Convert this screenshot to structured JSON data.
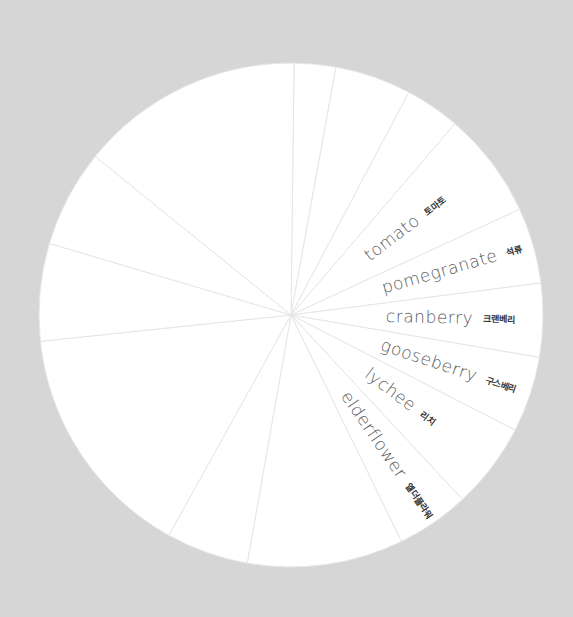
{
  "chart_data": {
    "type": "pie",
    "title": "",
    "center": [
      291,
      315
    ],
    "radius": 252,
    "start_angle_deg": 0.7,
    "background_color": "#d6d6d6",
    "slice_color": "#ffffff",
    "divider_color": "#e6e6e6",
    "slices": [
      {
        "label": "",
        "label_ko": "",
        "angle_deg": 9.6
      },
      {
        "label": "",
        "label_ko": "",
        "angle_deg": 17.6
      },
      {
        "label": "",
        "label_ko": "",
        "angle_deg": 12.7
      },
      {
        "label": "tomato",
        "label_ko": "토마토",
        "angle_deg": 24.6
      },
      {
        "label": "pomegranate",
        "label_ko": "석류",
        "angle_deg": 17.5
      },
      {
        "label": "cranberry",
        "label_ko": "크랜베리",
        "angle_deg": 17.0
      },
      {
        "label": "gooseberry",
        "label_ko": "구스베리",
        "angle_deg": 17.5
      },
      {
        "label": "lychee",
        "label_ko": "리치",
        "angle_deg": 19.9
      },
      {
        "label": "elderflower",
        "label_ko": "엘더플라워",
        "angle_deg": 16.9
      },
      {
        "label": "",
        "label_ko": "",
        "angle_deg": 36.0
      },
      {
        "label": "",
        "label_ko": "",
        "angle_deg": 19.0
      },
      {
        "label": "",
        "label_ko": "",
        "angle_deg": 55.0
      },
      {
        "label": "",
        "label_ko": "",
        "angle_deg": 22.5
      },
      {
        "label": "",
        "label_ko": "",
        "angle_deg": 22.5
      },
      {
        "label": "",
        "label_ko": "",
        "angle_deg": 51.7
      }
    ],
    "legend": null,
    "grid": false
  },
  "labels": {
    "tomato": {
      "en": "tomato",
      "ko": "토마토"
    },
    "pomegranate": {
      "en": "pomegranate",
      "ko": "석류"
    },
    "cranberry": {
      "en": "cranberry",
      "ko": "크랜베리"
    },
    "gooseberry": {
      "en": "gooseberry",
      "ko": "구스베리"
    },
    "lychee": {
      "en": "lychee",
      "ko": "리치"
    },
    "elderflower": {
      "en": "elderflower",
      "ko": "엘더플라워"
    }
  }
}
